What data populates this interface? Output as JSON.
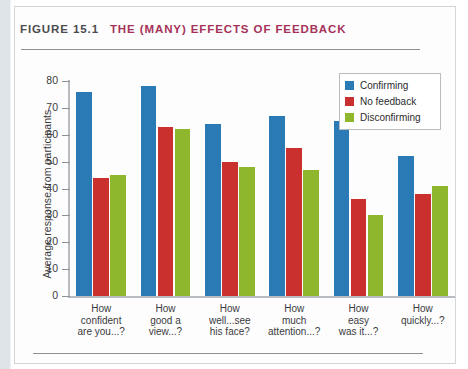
{
  "figure": {
    "number": "FIGURE 15.1",
    "caption": "THE (MANY) EFFECTS OF FEEDBACK",
    "number_color": "#4c4c4f",
    "caption_color": "#a6325a"
  },
  "chart_data": {
    "type": "bar",
    "title": "THE (MANY) EFFECTS OF FEEDBACK",
    "subtitle": "FIGURE 15.1",
    "xlabel": "",
    "ylabel": "Average response from participants",
    "ylim": [
      0,
      80
    ],
    "ytick_labels": [
      "80",
      "70",
      "60",
      "50",
      "40",
      "30",
      "20",
      "10",
      "0"
    ],
    "ytick_values": [
      80,
      70,
      60,
      50,
      40,
      30,
      20,
      10,
      0
    ],
    "grid": false,
    "legend_position": "top-right",
    "categories": [
      "How confident are you...?",
      "How good a view...?",
      "How well...see his face?",
      "How much attention...?",
      "How easy was it...?",
      "How quickly...?"
    ],
    "category_lines": [
      [
        "How",
        "confident",
        "are you...?"
      ],
      [
        "How",
        "good a",
        "view...?"
      ],
      [
        "How",
        "well...see",
        "his face?"
      ],
      [
        "How",
        "much",
        "attention...?"
      ],
      [
        "How",
        "easy",
        "was it...?"
      ],
      [
        "How",
        "quickly...?"
      ]
    ],
    "series": [
      {
        "name": "Confirming",
        "color": "#2a7ab5",
        "values": [
          76,
          78,
          64,
          67,
          65,
          52
        ]
      },
      {
        "name": "No feedback",
        "color": "#ca302d",
        "values": [
          44,
          63,
          50,
          55,
          36,
          38
        ]
      },
      {
        "name": "Disconfirming",
        "color": "#8fb72e",
        "values": [
          45,
          62,
          48,
          47,
          30,
          41
        ]
      }
    ]
  }
}
